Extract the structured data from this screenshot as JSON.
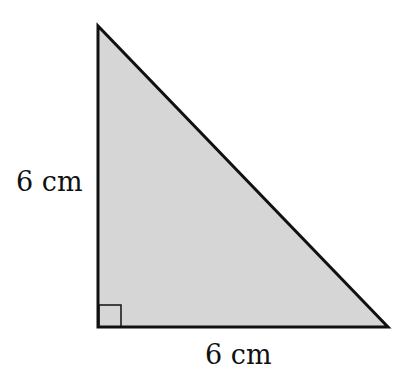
{
  "figure": {
    "type": "right-triangle",
    "fill_color": "#d6d6d6",
    "stroke_color": "#111111",
    "vertices": {
      "top": [
        98,
        26
      ],
      "right_angle": [
        98,
        327
      ],
      "bottom_right": [
        388,
        327
      ]
    },
    "right_angle_marker": true,
    "labels": {
      "vertical_side": "6 cm",
      "horizontal_side": "6 cm"
    }
  }
}
